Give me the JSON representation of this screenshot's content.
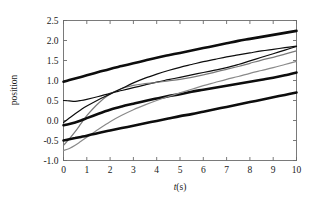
{
  "chart_data": {
    "type": "line",
    "title": "",
    "xlabel": "t(s)",
    "ylabel": "position",
    "xlim": [
      0,
      10
    ],
    "ylim": [
      -1.0,
      2.5
    ],
    "xticks": [
      0,
      1,
      2,
      3,
      4,
      5,
      6,
      7,
      8,
      9,
      10
    ],
    "xtick_labels": [
      "0",
      "1",
      "2",
      "3",
      "4",
      "5",
      "6",
      "7",
      "8",
      "9",
      "10"
    ],
    "yticks": [
      -1.0,
      -0.5,
      0.0,
      0.5,
      1.0,
      1.5,
      2.0,
      2.5
    ],
    "ytick_labels": [
      "-1.0",
      "-0.5",
      "0.0",
      "0.5",
      "1.0",
      "1.5",
      "2.0",
      "2.5"
    ],
    "grid": false,
    "legend": null,
    "x": [
      0,
      0.25,
      0.5,
      0.75,
      1,
      1.5,
      2,
      2.5,
      3,
      3.5,
      4,
      4.5,
      5,
      5.5,
      6,
      6.5,
      7,
      7.5,
      8,
      8.5,
      9,
      9.5,
      10
    ],
    "series": [
      {
        "name": "reference-upper",
        "color": "#0d0d0d",
        "width": 2.6,
        "values": [
          0.97,
          1.01,
          1.05,
          1.09,
          1.13,
          1.21,
          1.29,
          1.36,
          1.43,
          1.5,
          1.57,
          1.63,
          1.69,
          1.75,
          1.81,
          1.87,
          1.93,
          1.99,
          2.04,
          2.09,
          2.14,
          2.19,
          2.24
        ]
      },
      {
        "name": "trajectory-a",
        "color": "#0d0d0d",
        "width": 1.2,
        "values": [
          0.5,
          0.49,
          0.48,
          0.5,
          0.53,
          0.6,
          0.68,
          0.75,
          0.82,
          0.89,
          0.96,
          1.02,
          1.08,
          1.14,
          1.2,
          1.26,
          1.32,
          1.4,
          1.49,
          1.58,
          1.67,
          1.76,
          1.85
        ]
      },
      {
        "name": "trajectory-b",
        "color": "#7a7a7a",
        "width": 1.2,
        "values": [
          -0.62,
          -0.46,
          -0.28,
          -0.08,
          0.12,
          0.43,
          0.66,
          0.8,
          0.88,
          0.92,
          0.95,
          0.99,
          1.03,
          1.08,
          1.14,
          1.21,
          1.28,
          1.35,
          1.43,
          1.51,
          1.58,
          1.66,
          1.74
        ]
      },
      {
        "name": "trajectory-c",
        "color": "#0d0d0d",
        "width": 1.2,
        "values": [
          -0.05,
          0.06,
          0.17,
          0.27,
          0.36,
          0.52,
          0.66,
          0.8,
          0.94,
          1.06,
          1.16,
          1.25,
          1.33,
          1.4,
          1.47,
          1.53,
          1.59,
          1.64,
          1.69,
          1.74,
          1.78,
          1.82,
          1.86
        ]
      },
      {
        "name": "reference-middle",
        "color": "#0d0d0d",
        "width": 2.6,
        "values": [
          -0.12,
          -0.09,
          -0.05,
          0.0,
          0.06,
          0.17,
          0.27,
          0.35,
          0.42,
          0.49,
          0.55,
          0.61,
          0.66,
          0.72,
          0.77,
          0.82,
          0.87,
          0.92,
          0.97,
          1.02,
          1.07,
          1.13,
          1.2
        ]
      },
      {
        "name": "trajectory-d",
        "color": "#8a8a8a",
        "width": 1.2,
        "values": [
          -0.75,
          -0.7,
          -0.62,
          -0.52,
          -0.42,
          -0.22,
          -0.03,
          0.13,
          0.27,
          0.39,
          0.5,
          0.6,
          0.69,
          0.78,
          0.87,
          0.95,
          1.03,
          1.1,
          1.18,
          1.25,
          1.32,
          1.4,
          1.48
        ]
      },
      {
        "name": "reference-lower",
        "color": "#0d0d0d",
        "width": 2.6,
        "values": [
          -0.5,
          -0.47,
          -0.44,
          -0.41,
          -0.38,
          -0.31,
          -0.25,
          -0.19,
          -0.13,
          -0.07,
          -0.01,
          0.05,
          0.11,
          0.16,
          0.22,
          0.28,
          0.34,
          0.4,
          0.46,
          0.52,
          0.58,
          0.64,
          0.7
        ]
      }
    ]
  },
  "axes": {
    "x_label": "t(s)",
    "x_label_italic_part": "t",
    "x_label_rest": "(s)",
    "y_label": "position"
  }
}
